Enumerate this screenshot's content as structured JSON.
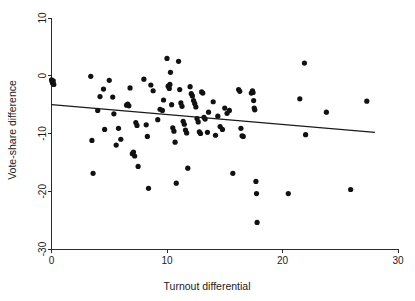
{
  "chart_data": {
    "type": "scatter",
    "title": "",
    "xlabel": "Turnout differential",
    "ylabel": "Vote-share difference",
    "xlim": [
      0,
      30
    ],
    "ylim": [
      -30,
      10
    ],
    "xticks": [
      0,
      10,
      20,
      30
    ],
    "xtick_labels": [
      "0",
      "10",
      "20",
      "30"
    ],
    "yticks": [
      10,
      0,
      -10,
      -20,
      -30
    ],
    "ytick_labels": [
      "10",
      "0",
      "-10",
      "-20",
      "-30"
    ],
    "grid": false,
    "legend": null,
    "point_color": "#111111",
    "point_radius": 2.6,
    "line_color": "#1a1a1a",
    "fit_line": {
      "name": "linear fit",
      "x_start": 0,
      "y_start": -5.0,
      "x_end": 28.0,
      "y_end": -9.8,
      "slope": -0.171,
      "intercept": -5.0
    },
    "points": [
      [
        0.0,
        -0.7
      ],
      [
        0.05,
        -1.0
      ],
      [
        0.1,
        -1.3
      ],
      [
        0.15,
        -0.9
      ],
      [
        0.2,
        -1.5
      ],
      [
        3.4,
        -0.1
      ],
      [
        3.5,
        -11.2
      ],
      [
        3.6,
        -16.9
      ],
      [
        4.0,
        -6.0
      ],
      [
        4.2,
        -3.6
      ],
      [
        4.5,
        -2.3
      ],
      [
        4.6,
        -9.3
      ],
      [
        5.0,
        -0.8
      ],
      [
        5.3,
        -3.7
      ],
      [
        5.4,
        -6.6
      ],
      [
        5.6,
        -12.0
      ],
      [
        5.8,
        -9.1
      ],
      [
        6.0,
        -11.0
      ],
      [
        6.5,
        -5.1
      ],
      [
        6.6,
        -4.9
      ],
      [
        6.7,
        -5.2
      ],
      [
        6.8,
        -2.1
      ],
      [
        7.0,
        -13.5
      ],
      [
        7.1,
        -13.2
      ],
      [
        7.2,
        -13.9
      ],
      [
        7.3,
        -8.1
      ],
      [
        7.4,
        -8.6
      ],
      [
        7.5,
        -15.7
      ],
      [
        8.0,
        -0.6
      ],
      [
        8.2,
        -8.5
      ],
      [
        8.3,
        -10.5
      ],
      [
        8.4,
        -19.5
      ],
      [
        8.6,
        -1.6
      ],
      [
        8.8,
        -2.6
      ],
      [
        9.2,
        -7.6
      ],
      [
        9.4,
        -5.8
      ],
      [
        9.6,
        -6.0
      ],
      [
        9.7,
        -4.2
      ],
      [
        10.0,
        3.0
      ],
      [
        10.1,
        -1.8
      ],
      [
        10.2,
        -2.2
      ],
      [
        10.25,
        -1.5
      ],
      [
        10.3,
        0.6
      ],
      [
        10.4,
        -5.0
      ],
      [
        10.5,
        -9.0
      ],
      [
        10.6,
        -9.6
      ],
      [
        10.7,
        -11.5
      ],
      [
        10.8,
        -18.6
      ],
      [
        11.0,
        2.5
      ],
      [
        11.1,
        -2.4
      ],
      [
        11.2,
        -4.7
      ],
      [
        11.3,
        -5.3
      ],
      [
        11.4,
        -7.9
      ],
      [
        11.5,
        -8.4
      ],
      [
        11.6,
        -9.4
      ],
      [
        11.7,
        -9.9
      ],
      [
        11.8,
        -16.0
      ],
      [
        12.0,
        -1.9
      ],
      [
        12.1,
        -3.1
      ],
      [
        12.2,
        -3.5
      ],
      [
        12.3,
        -4.3
      ],
      [
        12.4,
        -4.8
      ],
      [
        12.5,
        -5.4
      ],
      [
        12.6,
        -7.4
      ],
      [
        12.7,
        -8.0
      ],
      [
        12.8,
        -9.7
      ],
      [
        12.9,
        -10.0
      ],
      [
        13.0,
        -2.8
      ],
      [
        13.1,
        -3.0
      ],
      [
        13.2,
        -7.2
      ],
      [
        13.3,
        -7.5
      ],
      [
        13.5,
        -9.8
      ],
      [
        13.6,
        -6.3
      ],
      [
        14.0,
        -4.5
      ],
      [
        14.2,
        -10.3
      ],
      [
        14.4,
        -7.0
      ],
      [
        14.6,
        -8.8
      ],
      [
        14.8,
        -9.3
      ],
      [
        15.0,
        -5.6
      ],
      [
        15.2,
        -6.5
      ],
      [
        15.4,
        -6.0
      ],
      [
        15.7,
        -16.9
      ],
      [
        16.2,
        -2.4
      ],
      [
        16.3,
        -2.7
      ],
      [
        16.4,
        -9.1
      ],
      [
        16.5,
        -10.4
      ],
      [
        16.6,
        -10.5
      ],
      [
        17.3,
        -3.0
      ],
      [
        17.4,
        -2.6
      ],
      [
        17.45,
        -2.9
      ],
      [
        17.5,
        -4.3
      ],
      [
        17.55,
        -5.6
      ],
      [
        17.6,
        -5.9
      ],
      [
        17.7,
        -18.3
      ],
      [
        17.75,
        -20.4
      ],
      [
        17.8,
        -25.4
      ],
      [
        20.5,
        -20.4
      ],
      [
        21.9,
        2.2
      ],
      [
        22.0,
        -10.2
      ],
      [
        21.5,
        -4.0
      ],
      [
        23.8,
        -6.3
      ],
      [
        25.9,
        -19.7
      ],
      [
        27.3,
        -4.4
      ]
    ]
  },
  "axes": {
    "x_axis_name": "x-axis",
    "y_axis_name": "y-axis"
  }
}
